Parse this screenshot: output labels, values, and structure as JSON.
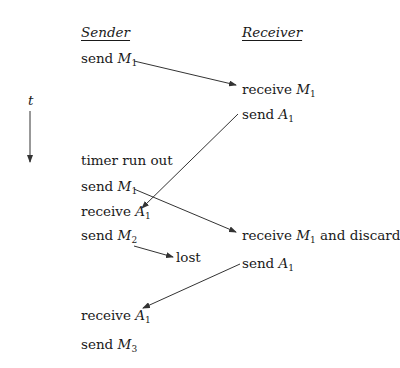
{
  "headers": {
    "sender": "Sender",
    "receiver": "Receiver"
  },
  "time_axis": {
    "label": "t"
  },
  "sender_events": [
    {
      "text": "send ",
      "var": "M",
      "sub": "1"
    },
    {
      "text": "timer run out",
      "var": "",
      "sub": ""
    },
    {
      "text": "send ",
      "var": "M",
      "sub": "1"
    },
    {
      "text": "receive ",
      "var": "A",
      "sub": "1"
    },
    {
      "text": "send ",
      "var": "M",
      "sub": "2"
    },
    {
      "text": "receive ",
      "var": "A",
      "sub": "1"
    },
    {
      "text": "send ",
      "var": "M",
      "sub": "3"
    }
  ],
  "receiver_events": [
    {
      "text": "receive ",
      "var": "M",
      "sub": "1",
      "suffix": ""
    },
    {
      "text": "send ",
      "var": "A",
      "sub": "1",
      "suffix": ""
    },
    {
      "text": "receive ",
      "var": "M",
      "sub": "1",
      "suffix": " and discard"
    },
    {
      "text": "send ",
      "var": "A",
      "sub": "1",
      "suffix": ""
    }
  ],
  "lost_label": "lost",
  "colors": {
    "line": "#333333",
    "text": "#1a1a1a"
  }
}
